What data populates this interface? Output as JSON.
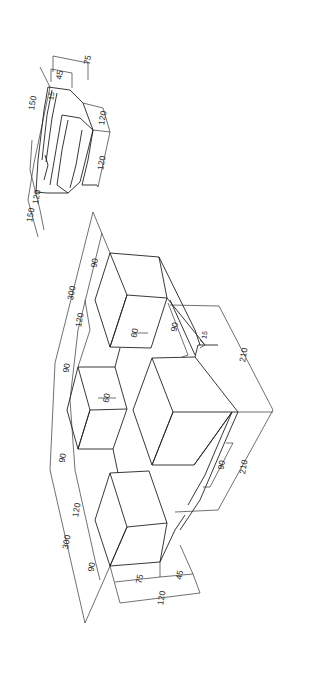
{
  "diagram": {
    "type": "isometric technical drawing",
    "line_color": "#222222",
    "background": "#ffffff",
    "small_figure": {
      "labels": {
        "d75": "75",
        "d45": "45",
        "d15": "15",
        "d150_top": "150",
        "d120_right_top": "120",
        "d120_right_bottom": "120",
        "d120_left": "120",
        "d150_bottom": "150"
      }
    },
    "main_figure": {
      "labels": {
        "d300_top": "300",
        "d90_a": "90",
        "d120_a": "120",
        "d90_b": "90",
        "d60_a": "60",
        "d60_b": "60",
        "d90_c": "90",
        "d15": "15",
        "d210_top": "210",
        "d210_bottom": "210",
        "d90_d": "90",
        "d90_e": "90",
        "d120_b": "120",
        "d300_bottom": "300",
        "d90_f": "90",
        "d75": "75",
        "d45": "45",
        "d120_c": "120"
      }
    }
  }
}
